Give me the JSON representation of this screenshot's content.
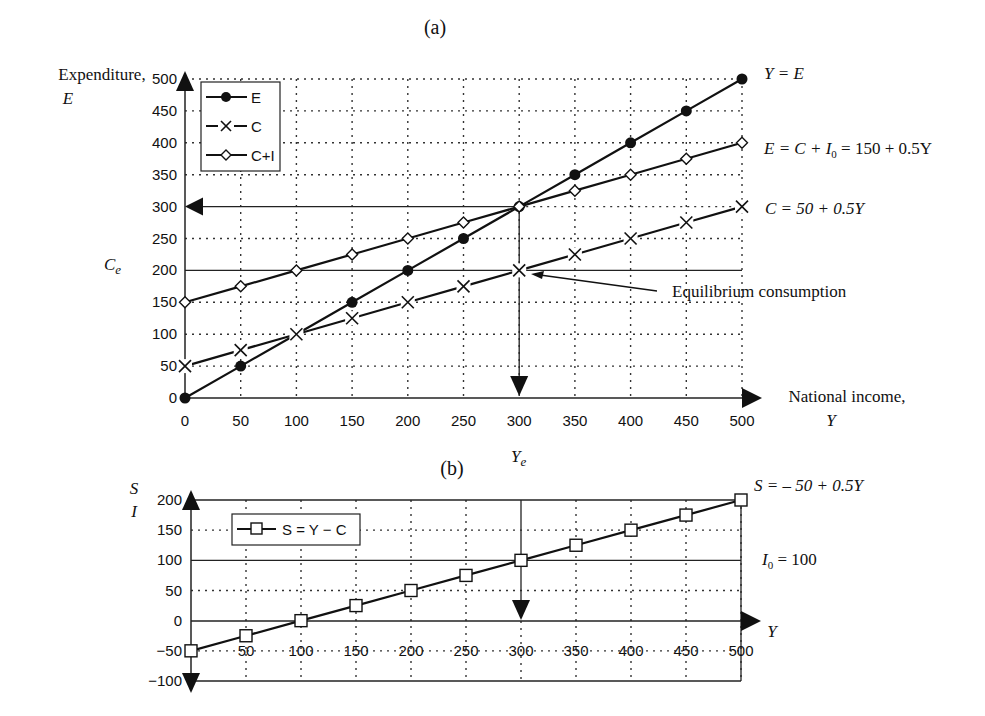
{
  "chart_data": [
    {
      "id": "a",
      "type": "line",
      "panel_label": "(a)",
      "title": "(a)",
      "ylabel": "Expenditure, E",
      "ylabel_line1": "Expenditure,",
      "ylabel_line2": "E",
      "xlabel": "National income, Y",
      "xlabel_line1": "National income,",
      "xlabel_line2": "Y",
      "x": [
        0,
        50,
        100,
        150,
        200,
        250,
        300,
        350,
        400,
        450,
        500
      ],
      "xlim": [
        0,
        500
      ],
      "ylim": [
        0,
        500
      ],
      "xticks": [
        "0",
        "50",
        "100",
        "150",
        "200",
        "250",
        "300",
        "350",
        "400",
        "450",
        "500"
      ],
      "yticks": [
        "0",
        "50",
        "100",
        "150",
        "200",
        "250",
        "300",
        "350",
        "400",
        "450",
        "500"
      ],
      "grid": "dotted",
      "legend_position": "upper-left",
      "series": [
        {
          "name": "E",
          "marker": "filled-circle",
          "line": "solid",
          "values": [
            0,
            50,
            100,
            150,
            200,
            250,
            300,
            350,
            400,
            450,
            500
          ]
        },
        {
          "name": "C",
          "marker": "x",
          "line": "dashed",
          "values": [
            50,
            75,
            100,
            125,
            150,
            175,
            200,
            225,
            250,
            275,
            300
          ]
        },
        {
          "name": "C+I",
          "marker": "open-diamond",
          "line": "solid",
          "values": [
            150,
            175,
            200,
            225,
            250,
            275,
            300,
            325,
            350,
            375,
            400
          ]
        }
      ],
      "annotations": {
        "y_eq_e": "Y = E",
        "e_eq": "E = C + I₀ = 150 + 0.5Y",
        "e_eq_parts": {
          "pre": "E = C + ",
          "i": "I",
          "sub": "0",
          "post": " = 150 + 0.5Y"
        },
        "c_eq": "C = 50 + 0.5Y",
        "ce_label": "C",
        "ce_sub": "e",
        "ye_label": "Y",
        "ye_sub": "e",
        "equilibrium_consumption": "Equilibrium consumption",
        "equilibrium_income": 300,
        "equilibrium_expenditure": 300,
        "equilibrium_consumption_value": 200
      }
    },
    {
      "id": "b",
      "type": "line",
      "panel_label": "(b)",
      "title": "(b)",
      "ylabel_line1": "S",
      "ylabel_line2": "I",
      "xlabel": "Y",
      "x": [
        0,
        50,
        100,
        150,
        200,
        250,
        300,
        350,
        400,
        450,
        500
      ],
      "xlim": [
        0,
        500
      ],
      "ylim": [
        -100,
        200
      ],
      "xticks": [
        "0",
        "50",
        "100",
        "150",
        "200",
        "250",
        "300",
        "350",
        "400",
        "450",
        "500"
      ],
      "yticks": [
        "−100",
        "−50",
        "0",
        "50",
        "100",
        "150",
        "200"
      ],
      "ytick_values": [
        -100,
        -50,
        0,
        50,
        100,
        150,
        200
      ],
      "grid": "dotted",
      "legend_position": "upper-left",
      "series": [
        {
          "name": "S = Y − C",
          "marker": "open-square",
          "line": "solid",
          "values": [
            -50,
            -25,
            0,
            25,
            50,
            75,
            100,
            125,
            150,
            175,
            200
          ]
        }
      ],
      "annotations": {
        "s_eq": "S = – 50 + 0.5Y",
        "i0_label": "I",
        "i0_sub": "0",
        "i0_post": " = 100",
        "i0_value": 100
      }
    }
  ]
}
